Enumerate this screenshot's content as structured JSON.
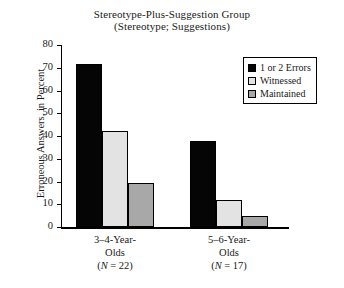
{
  "chart_data": {
    "type": "bar",
    "title": "Stereotype-Plus-Suggestion Group",
    "subtitle": "(Stereotype; Suggestions)",
    "xlabel": "",
    "ylabel": "Erroneous Answers, in Percent",
    "ylim": [
      0,
      80
    ],
    "yticks": [
      0,
      10,
      20,
      30,
      40,
      50,
      60,
      70,
      80
    ],
    "grid": false,
    "legend_position": "top-right",
    "categories": [
      "3–4-Year-Olds",
      "5–6-Year-Olds"
    ],
    "category_lines": [
      [
        "3–4-Year-",
        "Olds",
        "(N = 22)"
      ],
      [
        "5–6-Year-",
        "Olds",
        "(N = 17)"
      ]
    ],
    "group_n": [
      22,
      17
    ],
    "series": [
      {
        "name": "1 or 2 Errors",
        "values": [
          71.5,
          38
        ],
        "color": "#050505"
      },
      {
        "name": "Witnessed",
        "values": [
          42,
          12
        ],
        "color": "#e3e3e3"
      },
      {
        "name": "Maintained",
        "values": [
          19.5,
          5
        ],
        "color": "#a8a8a8"
      }
    ]
  },
  "legend": {
    "items": [
      {
        "label": "1 or 2 Errors",
        "color": "#050505"
      },
      {
        "label": "Witnessed",
        "color": "#e3e3e3"
      },
      {
        "label": "Maintained",
        "color": "#a8a8a8"
      }
    ]
  }
}
